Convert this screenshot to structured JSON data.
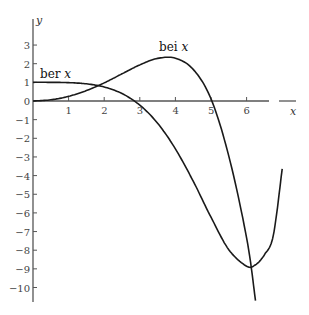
{
  "chart_data": {
    "type": "line",
    "title": "",
    "xlabel": "x",
    "ylabel": "y",
    "xlim": [
      0,
      7
    ],
    "ylim": [
      -10.8,
      4.4
    ],
    "grid": false,
    "x_ticks": [
      1,
      2,
      3,
      4,
      5,
      6
    ],
    "y_ticks": [
      3,
      2,
      1,
      0,
      -1,
      -2,
      -3,
      -4,
      -5,
      -6,
      -7,
      -8,
      -9,
      -10
    ],
    "series": [
      {
        "name": "ber x",
        "label_main": "ber",
        "label_var": "x",
        "x": [
          0,
          0.5,
          1,
          1.5,
          2,
          2.5,
          3,
          3.5,
          4,
          4.5,
          5,
          5.5,
          6,
          6.25,
          6.5,
          6.75,
          7
        ],
        "y": [
          1,
          0.999,
          0.9844,
          0.9211,
          0.7517,
          0.4,
          -0.2214,
          -1.1936,
          -2.5634,
          -4.2991,
          -6.2301,
          -7.9729,
          -8.8583,
          -8.7805,
          -8.2453,
          -7.2059,
          -3.6329
        ]
      },
      {
        "name": "bei x",
        "label_main": "bei",
        "label_var": "x",
        "x": [
          0,
          0.5,
          1,
          1.5,
          2,
          2.5,
          3,
          3.5,
          4,
          4.5,
          5,
          5.5,
          6,
          6.25
        ],
        "y": [
          0,
          0.0625,
          0.2496,
          0.5576,
          0.9723,
          1.4572,
          1.9376,
          2.2832,
          2.2927,
          1.6938,
          0.116,
          -2.9555,
          -7.3347,
          -10.7
        ]
      }
    ]
  }
}
